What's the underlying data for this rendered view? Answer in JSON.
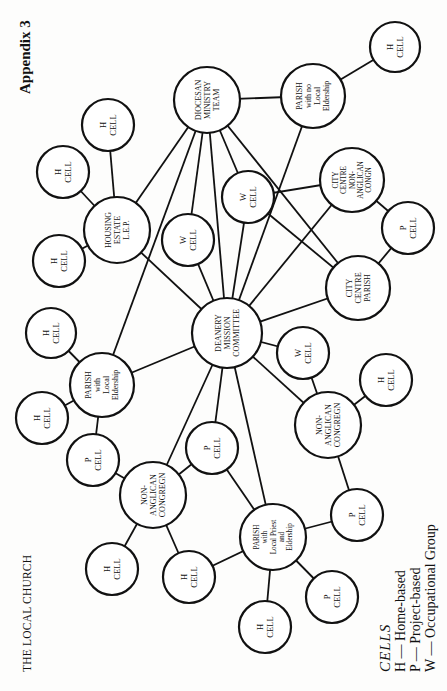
{
  "header": {
    "appendix_label": "Appendix 3",
    "running_head": "THE LOCAL CHURCH"
  },
  "legend": {
    "title": "CELLS",
    "items": [
      {
        "code": "H",
        "label": "H — Home-based"
      },
      {
        "code": "P",
        "label": "P — Project-based"
      },
      {
        "code": "W",
        "label": "W — Occupational Group"
      }
    ]
  },
  "diagram": {
    "nodes": [
      {
        "id": "deanery",
        "lines": [
          "DEANERY",
          "MISSION",
          "COMMITTEE"
        ],
        "x": 227,
        "y": 333,
        "r": 35
      },
      {
        "id": "diocesan",
        "lines": [
          "DIOCESAN",
          "MINISTRY",
          "TEAM"
        ],
        "x": 207,
        "y": 100,
        "r": 33
      },
      {
        "id": "parish_no_local",
        "lines": [
          "PARISH",
          "with no",
          "Local",
          "Eldership"
        ],
        "x": 313,
        "y": 96,
        "r": 32
      },
      {
        "id": "h_top_right",
        "lines": [
          "H",
          "CELL"
        ],
        "x": 395,
        "y": 47,
        "r": 25
      },
      {
        "id": "housing_estate",
        "lines": [
          "HOUSING",
          "ESTATE",
          "L.E.P."
        ],
        "x": 117,
        "y": 230,
        "r": 33
      },
      {
        "id": "h_he_top",
        "lines": [
          "H",
          "CELL"
        ],
        "x": 108,
        "y": 125,
        "r": 26
      },
      {
        "id": "h_he_left",
        "lines": [
          "H",
          "CELL"
        ],
        "x": 63,
        "y": 172,
        "r": 26
      },
      {
        "id": "h_he_bottom",
        "lines": [
          "H",
          "CELL"
        ],
        "x": 59,
        "y": 261,
        "r": 26
      },
      {
        "id": "w_left",
        "lines": [
          "W",
          "CELL"
        ],
        "x": 188,
        "y": 240,
        "r": 26
      },
      {
        "id": "w_upper",
        "lines": [
          "W",
          "CELL"
        ],
        "x": 248,
        "y": 197,
        "r": 26
      },
      {
        "id": "city_non_anglican",
        "lines": [
          "CITY",
          "CENTRE",
          "NON-",
          "ANGLICAN",
          "CONGN"
        ],
        "x": 352,
        "y": 180,
        "r": 32
      },
      {
        "id": "p_city",
        "lines": [
          "P",
          "CELL"
        ],
        "x": 408,
        "y": 228,
        "r": 26
      },
      {
        "id": "city_parish",
        "lines": [
          "CITY",
          "CENTRE",
          "PARISH"
        ],
        "x": 358,
        "y": 288,
        "r": 32
      },
      {
        "id": "parish_local_eldership",
        "lines": [
          "PARISH",
          "with",
          "Local",
          "Eldership"
        ],
        "x": 102,
        "y": 385,
        "r": 32
      },
      {
        "id": "h_ple_top",
        "lines": [
          "H",
          "CELL"
        ],
        "x": 51,
        "y": 333,
        "r": 25
      },
      {
        "id": "h_ple_left",
        "lines": [
          "H",
          "CELL"
        ],
        "x": 42,
        "y": 418,
        "r": 26
      },
      {
        "id": "p_ple",
        "lines": [
          "P",
          "CELL"
        ],
        "x": 93,
        "y": 460,
        "r": 26
      },
      {
        "id": "non_anglican_left",
        "lines": [
          "NON-",
          "ANGLICAN",
          "CONGREGN"
        ],
        "x": 153,
        "y": 495,
        "r": 33
      },
      {
        "id": "p_center",
        "lines": [
          "P",
          "CELL"
        ],
        "x": 212,
        "y": 448,
        "r": 26
      },
      {
        "id": "h_nal_left",
        "lines": [
          "H",
          "CELL"
        ],
        "x": 112,
        "y": 569,
        "r": 26
      },
      {
        "id": "h_nal_right",
        "lines": [
          "H",
          "CELL"
        ],
        "x": 189,
        "y": 577,
        "r": 26
      },
      {
        "id": "parish_local_priest",
        "lines": [
          "PARISH",
          "with",
          "Local Priest",
          "and",
          "Eldership"
        ],
        "x": 273,
        "y": 537,
        "r": 33
      },
      {
        "id": "h_plp_bottom",
        "lines": [
          "H",
          "CELL"
        ],
        "x": 265,
        "y": 627,
        "r": 26
      },
      {
        "id": "p_plp_bottom",
        "lines": [
          "P",
          "CELL"
        ],
        "x": 332,
        "y": 597,
        "r": 26
      },
      {
        "id": "p_plp_right",
        "lines": [
          "P",
          "CELL"
        ],
        "x": 357,
        "y": 515,
        "r": 26
      },
      {
        "id": "non_anglican_right",
        "lines": [
          "NON-",
          "ANGLICAN",
          "CONGREGN"
        ],
        "x": 328,
        "y": 425,
        "r": 33
      },
      {
        "id": "w_right",
        "lines": [
          "W",
          "CELL"
        ],
        "x": 303,
        "y": 353,
        "r": 26
      },
      {
        "id": "h_nar",
        "lines": [
          "H",
          "CELL"
        ],
        "x": 386,
        "y": 380,
        "r": 26
      }
    ],
    "edges": [
      [
        "diocesan",
        "parish_no_local"
      ],
      [
        "parish_no_local",
        "h_top_right"
      ],
      [
        "diocesan",
        "housing_estate"
      ],
      [
        "diocesan",
        "parish_local_eldership"
      ],
      [
        "diocesan",
        "w_left"
      ],
      [
        "diocesan",
        "deanery"
      ],
      [
        "diocesan",
        "w_upper"
      ],
      [
        "diocesan",
        "city_parish"
      ],
      [
        "parish_no_local",
        "deanery"
      ],
      [
        "w_upper",
        "city_non_anglican"
      ],
      [
        "w_upper",
        "city_parish"
      ],
      [
        "w_upper",
        "deanery"
      ],
      [
        "city_non_anglican",
        "deanery"
      ],
      [
        "city_non_anglican",
        "p_city"
      ],
      [
        "p_city",
        "city_parish"
      ],
      [
        "city_parish",
        "deanery"
      ],
      [
        "housing_estate",
        "h_he_top"
      ],
      [
        "housing_estate",
        "h_he_left"
      ],
      [
        "housing_estate",
        "h_he_bottom"
      ],
      [
        "housing_estate",
        "deanery"
      ],
      [
        "w_left",
        "deanery"
      ],
      [
        "parish_local_eldership",
        "deanery"
      ],
      [
        "parish_local_eldership",
        "h_ple_top"
      ],
      [
        "parish_local_eldership",
        "h_ple_left"
      ],
      [
        "parish_local_eldership",
        "p_ple"
      ],
      [
        "p_ple",
        "non_anglican_left"
      ],
      [
        "deanery",
        "non_anglican_left"
      ],
      [
        "deanery",
        "p_center"
      ],
      [
        "deanery",
        "parish_local_priest"
      ],
      [
        "p_center",
        "non_anglican_left"
      ],
      [
        "p_center",
        "parish_local_priest"
      ],
      [
        "non_anglican_left",
        "h_nal_left"
      ],
      [
        "non_anglican_left",
        "h_nal_right"
      ],
      [
        "h_nal_right",
        "parish_local_priest"
      ],
      [
        "parish_local_priest",
        "h_plp_bottom"
      ],
      [
        "parish_local_priest",
        "p_plp_bottom"
      ],
      [
        "parish_local_priest",
        "p_plp_right"
      ],
      [
        "p_plp_right",
        "non_anglican_right"
      ],
      [
        "deanery",
        "non_anglican_right"
      ],
      [
        "deanery",
        "w_right"
      ],
      [
        "w_right",
        "non_anglican_right"
      ],
      [
        "non_anglican_right",
        "h_nar"
      ]
    ]
  }
}
